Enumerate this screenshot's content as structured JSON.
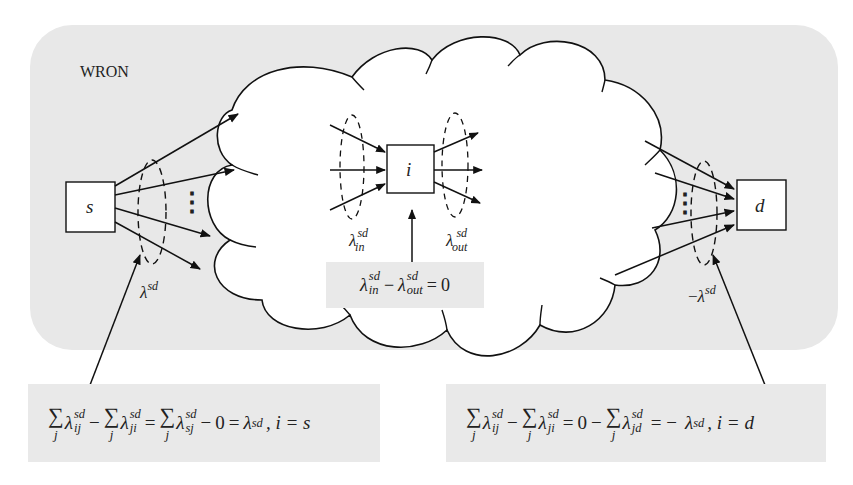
{
  "figure": {
    "region_label": "WRON",
    "colors": {
      "region_fill": "#e8e8e8",
      "cloud_fill": "#ffffff",
      "stroke": "#111111",
      "equation_box_fill": "#e9e9e9"
    },
    "nodes": {
      "source": {
        "label": "s"
      },
      "intermediate": {
        "label": "i"
      },
      "destination": {
        "label": "d"
      }
    },
    "flow_labels": {
      "source_out": {
        "symbol": "λ",
        "sup": "sd"
      },
      "destination_in": {
        "prefix": "−",
        "symbol": "λ",
        "sup": "sd"
      },
      "node_in": {
        "symbol": "λ",
        "sup": "sd",
        "sub": "in"
      },
      "node_out": {
        "symbol": "λ",
        "sup": "sd",
        "sub": "out"
      }
    },
    "ellipsis_glyph": "⋮",
    "equations": {
      "center": {
        "lam": "λ",
        "sup1": "sd",
        "sub1": "in",
        "minus": "−",
        "sup2": "sd",
        "sub2": "out",
        "equals": "=",
        "rhs": "0"
      },
      "left": {
        "sigma": "∑",
        "sum_index": "j",
        "lam": "λ",
        "sup": "sd",
        "sub1": "ij",
        "sub2": "ji",
        "sub3": "sj",
        "minus": "−",
        "equals": "=",
        "zero_term": "0",
        "result": "λ",
        "result_sup": "sd",
        "condition": ", i = s"
      },
      "right": {
        "sigma": "∑",
        "sum_index": "j",
        "lam": "λ",
        "sup": "sd",
        "sub1": "ij",
        "sub2": "ji",
        "sub3": "jd",
        "minus": "−",
        "equals": "=",
        "zero_term": "0",
        "result_prefix": "= −",
        "result": "λ",
        "result_sup": "sd",
        "condition": ", i = d"
      }
    }
  }
}
